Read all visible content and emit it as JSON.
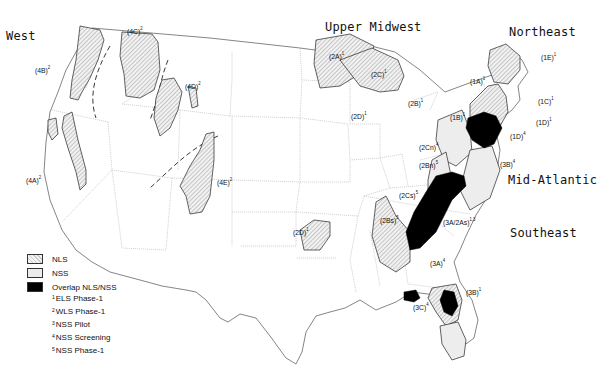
{
  "regions": {
    "west": "West",
    "upper_midwest": "Upper Midwest",
    "northeast": "Northeast",
    "mid_atlantic": "Mid-Atlantic",
    "southeast": "Southeast"
  },
  "area_labels": [
    {
      "id": "4A",
      "text": "(4A)",
      "sup": "2"
    },
    {
      "id": "4B",
      "text": "(4B)",
      "sup": "2"
    },
    {
      "id": "4C",
      "text": "(4C)",
      "sup": "2"
    },
    {
      "id": "4D",
      "text": "(4D)",
      "sup": "2"
    },
    {
      "id": "4E",
      "text": "(4E)",
      "sup": "2"
    },
    {
      "id": "2A",
      "text": "(2A)",
      "sup": "1"
    },
    {
      "id": "2C",
      "text": "(2C)",
      "sup": "1"
    },
    {
      "id": "2D_north",
      "text": "(2D)",
      "sup": "1"
    },
    {
      "id": "2B",
      "text": "(2B)",
      "sup": "1"
    },
    {
      "id": "2D_south",
      "text": "(2D)",
      "sup": "1"
    },
    {
      "id": "1A",
      "text": "(1A)",
      "sup": "1"
    },
    {
      "id": "1E",
      "text": "(1E)",
      "sup": "1"
    },
    {
      "id": "1C",
      "text": "(1C)",
      "sup": "1"
    },
    {
      "id": "1D_east",
      "text": "(1D)",
      "sup": "1"
    },
    {
      "id": "1D_south",
      "text": "(1D)",
      "sup": "4"
    },
    {
      "id": "1B",
      "text": "(1B)",
      "sup": "1"
    },
    {
      "id": "2Cn",
      "text": "(2Cn)",
      "sup": "4"
    },
    {
      "id": "2Bn",
      "text": "(2Bn)",
      "sup": "5"
    },
    {
      "id": "3B_north",
      "text": "(3B)",
      "sup": "4"
    },
    {
      "id": "2Cs",
      "text": "(2Cs)",
      "sup": "5"
    },
    {
      "id": "2Bs",
      "text": "(2Bs)",
      "sup": "5"
    },
    {
      "id": "3A_2As",
      "text": "(3A/2As)",
      "sup": "1,3"
    },
    {
      "id": "3A",
      "text": "(3A)",
      "sup": "4"
    },
    {
      "id": "3B_south",
      "text": "(3B)",
      "sup": "1"
    },
    {
      "id": "3C",
      "text": "(3C)",
      "sup": "4"
    }
  ],
  "legend": {
    "items": [
      {
        "pattern": "hatched",
        "label": "NLS"
      },
      {
        "pattern": "light",
        "label": "NSS"
      },
      {
        "pattern": "solid",
        "label": "Overlap NLS/NSS"
      }
    ],
    "notes": [
      {
        "num": "1",
        "label": "ELS Phase-1"
      },
      {
        "num": "2",
        "label": "WLS Phase-1"
      },
      {
        "num": "3",
        "label": "NSS Pilot"
      },
      {
        "num": "4",
        "label": "NSS Screening"
      },
      {
        "num": "5",
        "label": "NSS Phase-1"
      }
    ]
  },
  "colors": {
    "nls_hatch": "#bdbdbd",
    "nss_fill": "#ececec",
    "overlap": "#000000",
    "boundary": "#888888",
    "outline": "#333333"
  }
}
